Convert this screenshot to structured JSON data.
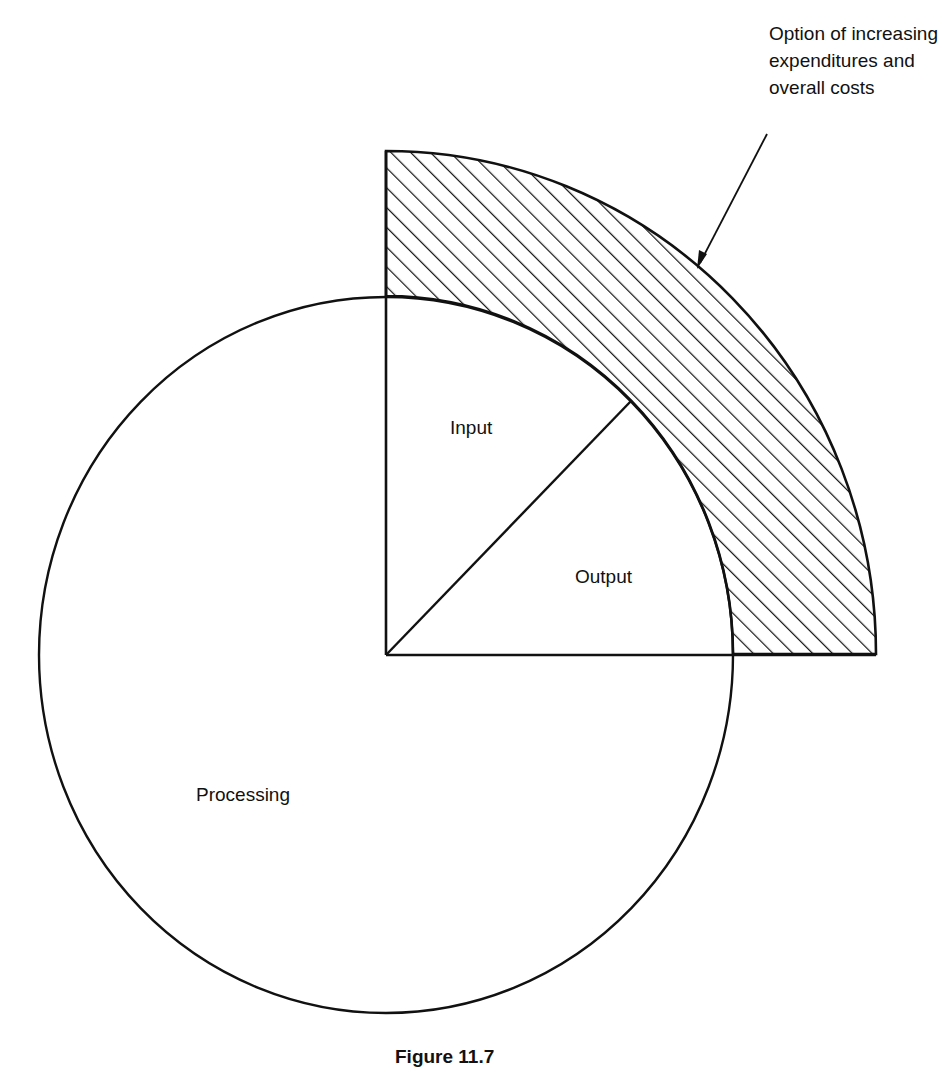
{
  "diagram": {
    "type": "sector diagram",
    "regions": {
      "processing": {
        "label": "Processing"
      },
      "input": {
        "label": "Input"
      },
      "output": {
        "label": "Output"
      },
      "expansion": {
        "label_lines": [
          "Option of increasing",
          "expenditures and",
          "overall costs"
        ],
        "fill": "diagonal hatching"
      }
    },
    "caption": "Figure 11.7",
    "colors": {
      "stroke": "#111111",
      "background": "#ffffff"
    }
  }
}
